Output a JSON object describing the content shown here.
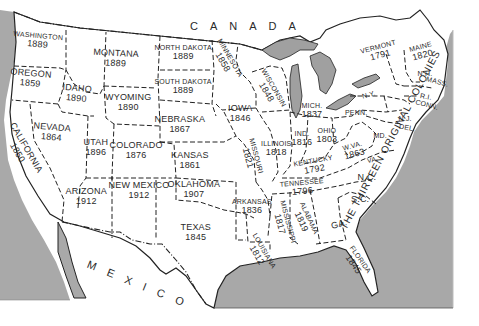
{
  "map": {
    "title": "United States admission dates",
    "colors": {
      "land": "#ffffff",
      "water": "#a8a8a8",
      "border": "#222222"
    },
    "countries": [
      {
        "name": "CANADA",
        "x": 190,
        "y": 20,
        "rotate": 0
      },
      {
        "name": "MEXICO",
        "x": 90,
        "y": 258,
        "rotate": 22
      }
    ],
    "states": [
      {
        "name": "WASHINGTON",
        "year": "1889",
        "x": 38,
        "y": 40,
        "rotate": 5,
        "size": "small"
      },
      {
        "name": "OREGON",
        "year": "1859",
        "x": 30,
        "y": 78,
        "rotate": 5
      },
      {
        "name": "CALIFORNIA",
        "year": "1850",
        "x": 22,
        "y": 150,
        "rotate": 60
      },
      {
        "name": "NEVADA",
        "year": "1864",
        "x": 52,
        "y": 132,
        "rotate": 5
      },
      {
        "name": "IDAHO",
        "year": "1890",
        "x": 77,
        "y": 93,
        "rotate": 5
      },
      {
        "name": "MONTANA",
        "year": "1889",
        "x": 116,
        "y": 58,
        "rotate": 3
      },
      {
        "name": "WYOMING",
        "year": "1890",
        "x": 128,
        "y": 102,
        "rotate": 0
      },
      {
        "name": "UTAH",
        "year": "1896",
        "x": 96,
        "y": 147,
        "rotate": 0
      },
      {
        "name": "COLORADO",
        "year": "1876",
        "x": 136,
        "y": 150,
        "rotate": 0
      },
      {
        "name": "ARIZONA",
        "year": "1912",
        "x": 86,
        "y": 196,
        "rotate": 0
      },
      {
        "name": "NEW MEXICO",
        "year": "1912",
        "x": 139,
        "y": 190,
        "rotate": 0
      },
      {
        "name": "NORTH DAKOTA",
        "year": "1889",
        "x": 183,
        "y": 52,
        "rotate": 0,
        "size": "small"
      },
      {
        "name": "SOUTH DAKOTA",
        "year": "1889",
        "x": 183,
        "y": 86,
        "rotate": 0,
        "size": "small"
      },
      {
        "name": "NEBRASKA",
        "year": "1867",
        "x": 180,
        "y": 124,
        "rotate": 0
      },
      {
        "name": "KANSAS",
        "year": "1861",
        "x": 190,
        "y": 160,
        "rotate": 0
      },
      {
        "name": "OKLAHOMA",
        "year": "1907",
        "x": 194,
        "y": 189,
        "rotate": 0
      },
      {
        "name": "TEXAS",
        "year": "1845",
        "x": 196,
        "y": 232,
        "rotate": 0
      },
      {
        "name": "MINNESOTA",
        "year": "1858",
        "x": 226,
        "y": 60,
        "rotate": 60,
        "size": "small"
      },
      {
        "name": "IOWA",
        "year": "1846",
        "x": 240,
        "y": 113,
        "rotate": 0
      },
      {
        "name": "MISSOURI",
        "year": "1821",
        "x": 252,
        "y": 157,
        "rotate": 75,
        "size": "small"
      },
      {
        "name": "ARKANSAS",
        "year": "1836",
        "x": 252,
        "y": 206,
        "rotate": 0,
        "size": "small"
      },
      {
        "name": "LOUISIANA",
        "year": "1812",
        "x": 260,
        "y": 253,
        "rotate": 60,
        "size": "small"
      },
      {
        "name": "WISCONSIN",
        "year": "1848",
        "x": 270,
        "y": 90,
        "rotate": 60,
        "size": "small"
      },
      {
        "name": "ILLINOIS",
        "year": "1818",
        "x": 276,
        "y": 148,
        "rotate": 0,
        "size": "small"
      },
      {
        "name": "MISSISSIPPI",
        "year": "1817",
        "x": 284,
        "y": 223,
        "rotate": 75,
        "size": "small"
      },
      {
        "name": "MICH.",
        "year": "1837",
        "x": 312,
        "y": 110,
        "rotate": 0,
        "size": "small"
      },
      {
        "name": "IND.",
        "year": "1816",
        "x": 302,
        "y": 138,
        "rotate": 0,
        "size": "small"
      },
      {
        "name": "OHIO",
        "year": "1803",
        "x": 327,
        "y": 135,
        "rotate": 0,
        "size": "small"
      },
      {
        "name": "KENTUCKY",
        "year": "1792",
        "x": 314,
        "y": 165,
        "rotate": -10,
        "size": "small"
      },
      {
        "name": "TENNESSEE",
        "year": "1796",
        "x": 302,
        "y": 187,
        "rotate": -5,
        "size": "small"
      },
      {
        "name": "ALABAMA",
        "year": "1819",
        "x": 305,
        "y": 220,
        "rotate": 65,
        "size": "small"
      },
      {
        "name": "W.VA.",
        "year": "1863",
        "x": 353,
        "y": 150,
        "rotate": -15,
        "size": "small"
      },
      {
        "name": "PENN.",
        "year": "",
        "x": 356,
        "y": 113,
        "rotate": 0,
        "size": "small"
      },
      {
        "name": "N.Y.",
        "year": "",
        "x": 369,
        "y": 95,
        "rotate": -15,
        "size": "small"
      },
      {
        "name": "VERMONT",
        "year": "1791",
        "x": 379,
        "y": 51,
        "rotate": -15,
        "size": "small"
      },
      {
        "name": "MAINE",
        "year": "1820",
        "x": 421,
        "y": 51,
        "rotate": -15,
        "size": "small"
      },
      {
        "name": "N.H.",
        "year": "",
        "x": 425,
        "y": 74,
        "rotate": 0,
        "size": "small"
      },
      {
        "name": "MASS.",
        "year": "",
        "x": 437,
        "y": 82,
        "rotate": 15,
        "size": "small"
      },
      {
        "name": "R.I.",
        "year": "",
        "x": 426,
        "y": 97,
        "rotate": 10,
        "size": "small"
      },
      {
        "name": "CONN.",
        "year": "",
        "x": 427,
        "y": 105,
        "rotate": 15,
        "size": "small"
      },
      {
        "name": "N.J.",
        "year": "",
        "x": 405,
        "y": 119,
        "rotate": 0,
        "size": "small"
      },
      {
        "name": "DEL.",
        "year": "",
        "x": 407,
        "y": 128,
        "rotate": 10,
        "size": "small"
      },
      {
        "name": "MD.",
        "year": "",
        "x": 380,
        "y": 136,
        "rotate": 0,
        "size": "small"
      },
      {
        "name": "VA.",
        "year": "",
        "x": 372,
        "y": 160,
        "rotate": -10,
        "size": "small"
      },
      {
        "name": "N.C.",
        "year": "",
        "x": 367,
        "y": 177,
        "rotate": 0
      },
      {
        "name": "S.C.",
        "year": "",
        "x": 360,
        "y": 199,
        "rotate": 0
      },
      {
        "name": "GA.",
        "year": "",
        "x": 339,
        "y": 224,
        "rotate": -15
      },
      {
        "name": "FLORIDA",
        "year": "1845",
        "x": 357,
        "y": 262,
        "rotate": 55,
        "size": "small"
      }
    ],
    "annotations": [
      {
        "text": "THE THIRTEEN ORIGINAL COLONIES",
        "x": 390,
        "y": 140,
        "rotate": -62
      }
    ]
  }
}
